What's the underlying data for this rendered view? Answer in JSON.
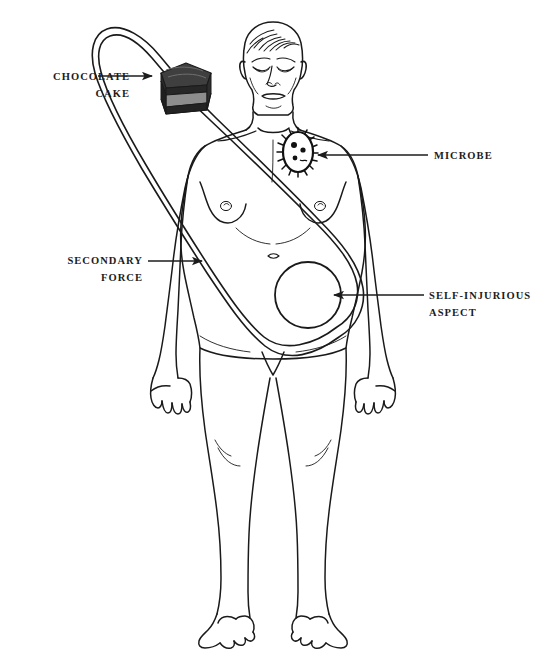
{
  "figure": {
    "type": "anatomical-diagram",
    "background_color": "#ffffff",
    "line_color": "#1a1a1a",
    "text_color": "#1c1c1c"
  },
  "labels": [
    {
      "id": "chocolate-cake",
      "line1": "CHOCOLATE",
      "line2": "CAKE",
      "align": "right",
      "side": "left",
      "points_to": "cake-wedge"
    },
    {
      "id": "secondary-force",
      "line1": "SECONDARY",
      "line2": "FORCE",
      "align": "right",
      "side": "left",
      "points_to": "loop-band"
    },
    {
      "id": "microbe",
      "line1": "MICROBE",
      "line2": "",
      "align": "left",
      "side": "right",
      "points_to": "microbe-oval"
    },
    {
      "id": "self-injurious-aspect",
      "line1": "SELF-INJURIOUS",
      "line2": "ASPECT",
      "align": "left",
      "side": "right",
      "points_to": "abdomen-circle"
    }
  ],
  "objects": {
    "cake": {
      "name": "chocolate-cake-wedge",
      "top_color": "#3a3a3a",
      "frosting_color": "#2b2b2b",
      "layer_light_color": "#8f8f8f",
      "layer_dark_color": "#262626"
    },
    "microbe": {
      "name": "microbe-oval",
      "fill": "#ffffff",
      "outline": "#111111",
      "has_cilia": true,
      "nuclei_count": 3
    },
    "abdomen_circle": {
      "name": "self-injurious-aspect-circle",
      "fill": "none",
      "outline": "#1a1a1a",
      "radius_px": 33
    },
    "loop": {
      "name": "secondary-force-band",
      "style": "double-line closed loop",
      "stroke": "#1a1a1a"
    }
  }
}
